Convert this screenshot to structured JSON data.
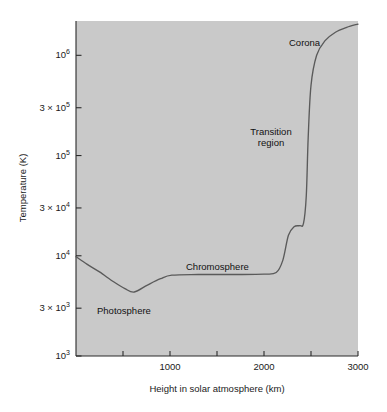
{
  "chart_data": {
    "type": "line",
    "title": "",
    "xlabel": "Height in solar atmosphere (km)",
    "ylabel": "Temperature (K)",
    "xscale": "linear",
    "yscale": "log",
    "xlim": [
      0,
      3000
    ],
    "ylim": [
      1000,
      2200000
    ],
    "grid": false,
    "legend": null,
    "x_ticks": [
      {
        "value": 1000,
        "label": "1000"
      },
      {
        "value": 2000,
        "label": "2000"
      },
      {
        "value": 3000,
        "label": "3000"
      }
    ],
    "x_minor_ticks": [
      500,
      1500,
      2500
    ],
    "y_ticks": [
      {
        "value": 1000,
        "mantissa": "10",
        "exponent": "3"
      },
      {
        "value": 3000,
        "mantissa": "3 × 10",
        "exponent": "3"
      },
      {
        "value": 10000,
        "mantissa": "10",
        "exponent": "4"
      },
      {
        "value": 30000,
        "mantissa": "3 × 10",
        "exponent": "4"
      },
      {
        "value": 100000,
        "mantissa": "10",
        "exponent": "5"
      },
      {
        "value": 300000,
        "mantissa": "3 × 10",
        "exponent": "5"
      },
      {
        "value": 1000000,
        "mantissa": "10",
        "exponent": "6"
      }
    ],
    "series": [
      {
        "name": "Solar atmosphere temperature profile",
        "color": "#5a5a5a",
        "x": [
          0,
          120,
          250,
          400,
          520,
          620,
          760,
          900,
          1020,
          1300,
          1700,
          2000,
          2130,
          2200,
          2260,
          2320,
          2380,
          2420,
          2450,
          2470,
          2500,
          2560,
          2650,
          2760,
          2880,
          3000
        ],
        "y": [
          9800,
          8200,
          6900,
          5500,
          4700,
          4350,
          5100,
          5900,
          6400,
          6500,
          6500,
          6550,
          6800,
          9000,
          16000,
          19500,
          20000,
          21000,
          40000,
          150000,
          500000,
          1000000,
          1400000,
          1700000,
          1900000,
          2050000
        ]
      }
    ],
    "annotations": [
      {
        "name": "corona",
        "text": "Corona",
        "x_km": 2640,
        "y_K": 1450000
      },
      {
        "name": "transition-region",
        "text_line1": "Transition",
        "text_line2": "region",
        "x_km": 2080,
        "y_K": 260000
      },
      {
        "name": "chromosphere",
        "text": "Chromosphere",
        "x_km": 1200,
        "y_K": 9000
      },
      {
        "name": "photosphere",
        "text": "Photosphere",
        "x_km": 330,
        "y_K": 3600
      }
    ],
    "colors": {
      "plot_background": "#c9c9c9",
      "figure_background": "#ffffff",
      "curve": "#5a5a5a",
      "axis": "#2b2b2b",
      "text": "#1a1a1a"
    }
  }
}
